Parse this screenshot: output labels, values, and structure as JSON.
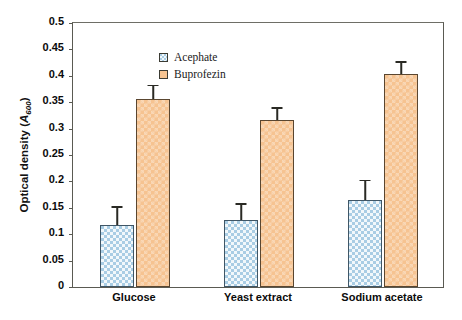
{
  "chart_data": {
    "type": "bar",
    "title": "",
    "xlabel": "",
    "ylabel": "Optical density (A600)",
    "ylabel_parts": {
      "prefix": "Optical density (",
      "italic": "A",
      "subscript": "600",
      "suffix": ")"
    },
    "categories": [
      "Glucose",
      "Yeast extract",
      "Sodium acetate"
    ],
    "series": [
      {
        "name": "Acephate",
        "color": "#a9cde4",
        "pattern": "checkered",
        "values": [
          0.118,
          0.126,
          0.165
        ],
        "errors": [
          0.032,
          0.03,
          0.035
        ]
      },
      {
        "name": "Buprofezin",
        "color": "#f6c391",
        "pattern": "solid-hatch",
        "values": [
          0.357,
          0.316,
          0.404
        ],
        "errors": [
          0.023,
          0.022,
          0.021
        ]
      }
    ],
    "ylim": [
      0,
      0.5
    ],
    "yticks": [
      0,
      0.05,
      0.1,
      0.15,
      0.2,
      0.25,
      0.3,
      0.35,
      0.4,
      0.45,
      0.5
    ],
    "ytick_labels": [
      "0",
      "0.05",
      "0.1",
      "0.15",
      "0.2",
      "0.25",
      "0.3",
      "0.35",
      "0.4",
      "0.45",
      "0.5"
    ],
    "grid": false,
    "legend_position": "top-left",
    "error_bar_style": "upper-only-with-cap",
    "frame": "box"
  },
  "legend": {
    "entries": [
      {
        "label": "Acephate",
        "color": "#a9cde4"
      },
      {
        "label": "Buprofezin",
        "color": "#f6c391"
      }
    ]
  },
  "colors": {
    "acephate": "#a9cde4",
    "buprofezin": "#f6c391",
    "axis": "#5a5a52",
    "text": "#0b0b0b",
    "error_bar": "#2a2a24"
  }
}
